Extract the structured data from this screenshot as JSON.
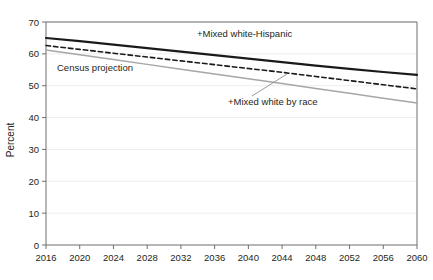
{
  "chart_data": {
    "type": "line",
    "title": "",
    "subtitle": "",
    "xlabel": "",
    "ylabel": "Percent",
    "xlim": [
      2016,
      2060
    ],
    "ylim": [
      0,
      70
    ],
    "grid": true,
    "grid_axis": "y",
    "legend_position": "inline-annotations",
    "x": [
      2016,
      2020,
      2024,
      2028,
      2032,
      2036,
      2040,
      2044,
      2048,
      2052,
      2056,
      2060
    ],
    "xticklabels": [
      "2016",
      "2020",
      "2024",
      "2028",
      "2032",
      "2036",
      "2040",
      "2044",
      "2048",
      "2052",
      "2056",
      "2060"
    ],
    "yticks": [
      0,
      10,
      20,
      30,
      40,
      50,
      60,
      70
    ],
    "yticklabels": [
      "0",
      "10",
      "20",
      "30",
      "40",
      "50",
      "60",
      "70"
    ],
    "series": [
      {
        "name": "+Mixed white-Hispanic",
        "style": "solid",
        "color": "#1a1a1a",
        "width": 2.1,
        "values": [
          65.0,
          64.0,
          62.9,
          61.8,
          60.7,
          59.6,
          58.5,
          57.4,
          56.3,
          55.3,
          54.3,
          53.4
        ]
      },
      {
        "name": "+Mixed white by race",
        "style": "dashed",
        "color": "#1a1a1a",
        "width": 1.6,
        "values": [
          62.6,
          61.4,
          60.2,
          59.0,
          57.8,
          56.6,
          55.4,
          54.2,
          52.9,
          51.6,
          50.3,
          49.0
        ]
      },
      {
        "name": "Census projection",
        "style": "solid",
        "color": "#a6a6a6",
        "width": 1.5,
        "values": [
          61.2,
          59.7,
          58.2,
          56.7,
          55.2,
          53.7,
          52.2,
          50.7,
          49.1,
          47.6,
          46.1,
          44.6
        ]
      }
    ],
    "annotations": [
      {
        "label": "+Mixed white-Hispanic",
        "series": "+Mixed white-Hispanic",
        "x": 197,
        "y": 37,
        "leader": false
      },
      {
        "label": "Census projection",
        "series": "Census projection",
        "x": 57,
        "y": 71,
        "leader": false
      },
      {
        "label": "+Mixed white by race",
        "series": "+Mixed white by race",
        "x": 228,
        "y": 105,
        "leader": true,
        "leader_from_x": 252,
        "leader_from_y": 96,
        "leader_to_x": 287,
        "leader_to_y": 74
      }
    ],
    "colors": {
      "axis": "#6e6e6e",
      "grid": "#ededed",
      "text": "#231f20",
      "series_primary": "#1a1a1a",
      "series_secondary": "#a6a6a6",
      "background": "#ffffff"
    }
  }
}
